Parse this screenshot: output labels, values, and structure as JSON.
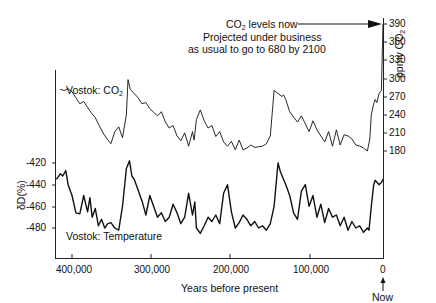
{
  "chart_data": [
    {
      "type": "line",
      "title": "",
      "series_name": "Vostok: CO2",
      "xlabel": "Years before present",
      "ylabel": "ppmv CO2",
      "axis_side": "right",
      "ylim": [
        180,
        390
      ],
      "yticks": [
        180,
        210,
        240,
        270,
        300,
        330,
        360,
        390
      ],
      "xlim": [
        420000,
        0
      ],
      "xticks": [
        400000,
        300000,
        200000,
        100000,
        0
      ],
      "x": [
        415000,
        410000,
        405000,
        400000,
        395000,
        390000,
        385000,
        380000,
        375000,
        370000,
        365000,
        360000,
        355000,
        350000,
        345000,
        340000,
        335000,
        330000,
        328000,
        325000,
        320000,
        315000,
        310000,
        305000,
        300000,
        295000,
        290000,
        285000,
        280000,
        275000,
        270000,
        265000,
        260000,
        255000,
        250000,
        245000,
        243000,
        240000,
        235000,
        230000,
        225000,
        220000,
        215000,
        210000,
        205000,
        200000,
        195000,
        190000,
        185000,
        180000,
        175000,
        170000,
        165000,
        160000,
        155000,
        150000,
        145000,
        140000,
        135000,
        130000,
        128000,
        125000,
        120000,
        115000,
        110000,
        105000,
        100000,
        95000,
        90000,
        85000,
        80000,
        75000,
        70000,
        65000,
        60000,
        55000,
        50000,
        45000,
        40000,
        35000,
        30000,
        25000,
        20000,
        17000,
        15000,
        12000,
        10000,
        8000,
        5000,
        2000,
        0
      ],
      "values": [
        282,
        280,
        283,
        278,
        268,
        258,
        262,
        252,
        243,
        235,
        222,
        210,
        200,
        192,
        212,
        220,
        202,
        240,
        298,
        282,
        275,
        268,
        258,
        260,
        250,
        244,
        238,
        245,
        228,
        218,
        222,
        205,
        197,
        210,
        188,
        212,
        198,
        232,
        248,
        230,
        218,
        222,
        204,
        212,
        195,
        188,
        196,
        182,
        198,
        182,
        185,
        190,
        186,
        187,
        188,
        192,
        205,
        280,
        275,
        270,
        273,
        265,
        245,
        236,
        228,
        238,
        225,
        212,
        230,
        215,
        205,
        195,
        212,
        188,
        215,
        190,
        207,
        205,
        200,
        190,
        188,
        185,
        180,
        200,
        240,
        258,
        265,
        260,
        275,
        280,
        390
      ],
      "label_annotation": "Vostok: CO2"
    },
    {
      "type": "line",
      "title": "",
      "series_name": "Vostok: Temperature",
      "xlabel": "Years before present",
      "ylabel": "δD(%)",
      "axis_side": "left",
      "ylim": [
        -490,
        -412
      ],
      "yticks": [
        -420,
        -440,
        -460,
        -480
      ],
      "xlim": [
        420000,
        0
      ],
      "xticks": [
        400000,
        300000,
        200000,
        100000,
        0
      ],
      "x": [
        420000,
        415000,
        412000,
        408000,
        405000,
        400000,
        395000,
        390000,
        385000,
        380000,
        377000,
        374000,
        370000,
        366000,
        362000,
        358000,
        354000,
        350000,
        345000,
        340000,
        335000,
        330000,
        326000,
        323000,
        320000,
        315000,
        310000,
        305000,
        300000,
        295000,
        290000,
        285000,
        280000,
        275000,
        270000,
        265000,
        260000,
        255000,
        250000,
        245000,
        242000,
        240000,
        235000,
        230000,
        225000,
        220000,
        215000,
        210000,
        205000,
        200000,
        195000,
        190000,
        185000,
        180000,
        175000,
        170000,
        165000,
        160000,
        155000,
        150000,
        145000,
        140000,
        135000,
        132000,
        128000,
        125000,
        120000,
        115000,
        110000,
        105000,
        100000,
        95000,
        90000,
        85000,
        80000,
        75000,
        70000,
        65000,
        60000,
        55000,
        50000,
        45000,
        40000,
        35000,
        30000,
        25000,
        20000,
        18000,
        15000,
        12000,
        10000,
        5000,
        2000,
        0
      ],
      "values": [
        -435,
        -430,
        -432,
        -427,
        -440,
        -450,
        -466,
        -467,
        -450,
        -465,
        -452,
        -470,
        -462,
        -478,
        -472,
        -480,
        -476,
        -475,
        -480,
        -482,
        -460,
        -425,
        -418,
        -432,
        -435,
        -445,
        -455,
        -468,
        -450,
        -460,
        -470,
        -466,
        -474,
        -470,
        -458,
        -466,
        -476,
        -470,
        -448,
        -468,
        -456,
        -480,
        -485,
        -478,
        -470,
        -474,
        -468,
        -476,
        -448,
        -440,
        -465,
        -480,
        -475,
        -468,
        -472,
        -478,
        -474,
        -480,
        -478,
        -482,
        -476,
        -460,
        -420,
        -428,
        -435,
        -440,
        -450,
        -466,
        -472,
        -446,
        -440,
        -460,
        -450,
        -470,
        -458,
        -475,
        -462,
        -470,
        -468,
        -478,
        -470,
        -482,
        -474,
        -480,
        -478,
        -484,
        -480,
        -482,
        -460,
        -440,
        -436,
        -440,
        -438,
        -435
      ],
      "label_annotation": "Vostok: Temperature"
    }
  ],
  "labels": {
    "co2_series": "Vostok: CO",
    "co2_sub": "2",
    "temp_series": "Vostok: Temperature",
    "annotation_line1_pre": "CO",
    "annotation_line1_sub": "2",
    "annotation_line1_post": " levels now",
    "annotation_line2": "Projected under business",
    "annotation_line3": "as usual to go to 680 by 2100",
    "right_axis_title_pre": "ppmv CO",
    "right_axis_title_sub": "2",
    "left_axis_title": "δD(%)",
    "x_axis_title": "Years before present",
    "now_label": "Now"
  },
  "right_ticks": [
    "390",
    "360",
    "330",
    "300",
    "270",
    "240",
    "210",
    "180"
  ],
  "left_ticks": [
    "-420",
    "-440",
    "-460",
    "-480"
  ],
  "x_ticks": [
    "400,000",
    "300,000",
    "200,000",
    "100,000",
    "0"
  ],
  "colors": {
    "line": "#111111",
    "axis": "#222222",
    "background": "#ffffff"
  }
}
